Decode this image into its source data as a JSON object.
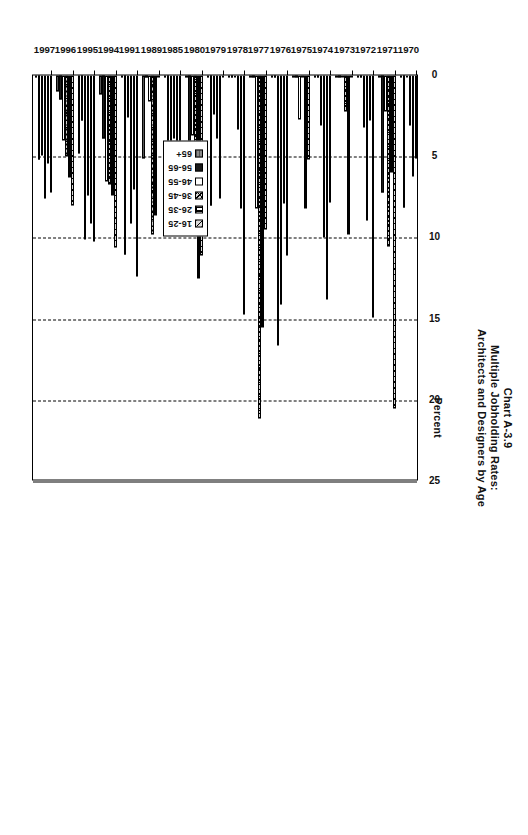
{
  "chart_data": {
    "type": "bar",
    "orientation": "horizontal",
    "title": "Chart A-3.9",
    "subtitle_line1": "Multiple Jobholding Rates:",
    "subtitle_line2": "Architects and Designers by Age",
    "xlabel": "Percent",
    "ylabel": "",
    "xlim": [
      0,
      25
    ],
    "xticks": [
      0,
      5,
      10,
      15,
      20,
      25
    ],
    "xtick_labels": [
      "0",
      "5",
      "10",
      "15",
      "20",
      "25"
    ],
    "grid": true,
    "legend_position": "inside-right",
    "categories": [
      "1970",
      "1971",
      "1972",
      "1973",
      "1974",
      "1975",
      "1976",
      "1977",
      "1978",
      "1979",
      "1980",
      "1985",
      "1989",
      "1991",
      "1994",
      "1995",
      "1996",
      "1997"
    ],
    "series": [
      {
        "name": "16-25",
        "values": [
          5.1,
          20.5,
          14.9,
          0.0,
          7.8,
          5.2,
          11.1,
          9.5,
          14.7,
          0.0,
          11.1,
          8.3,
          0.0,
          12.4,
          10.6,
          10.2,
          8.0,
          7.2
        ]
      },
      {
        "name": "26-35",
        "values": [
          6.2,
          6.0,
          2.8,
          9.8,
          13.8,
          8.2,
          7.9,
          15.5,
          8.2,
          7.6,
          12.5,
          8.3,
          8.6,
          7.0,
          7.4,
          9.1,
          6.3,
          5.4
        ]
      },
      {
        "name": "36-45",
        "values": [
          3.1,
          10.5,
          8.9,
          2.2,
          10.0,
          0.0,
          14.1,
          21.1,
          3.3,
          3.9,
          6.4,
          3.9,
          9.8,
          9.1,
          6.7,
          7.4,
          5.0,
          7.6
        ]
      },
      {
        "name": "46-55",
        "values": [
          0.0,
          2.2,
          3.2,
          0.0,
          3.1,
          2.7,
          16.6,
          8.2,
          0.0,
          2.4,
          3.7,
          6.7,
          1.6,
          2.6,
          6.5,
          10.1,
          4.0,
          4.9
        ]
      },
      {
        "name": "56-65",
        "values": [
          8.1,
          7.2,
          0.0,
          0.0,
          0.0,
          0.0,
          0.0,
          0.0,
          0.0,
          8.0,
          4.8,
          8.4,
          0.0,
          11.0,
          3.9,
          2.8,
          1.5,
          5.2
        ]
      },
      {
        "name": "65+",
        "values": [
          0.0,
          0.0,
          0.0,
          0.0,
          0.0,
          0.0,
          0.0,
          0.0,
          0.0,
          0.0,
          0.0,
          0.0,
          5.1,
          0.0,
          1.2,
          4.8,
          1.0,
          0.0
        ]
      }
    ],
    "series_colors": [
      "#d9d9d9",
      "#ffffff",
      "#cfcfcf",
      "#ffffff",
      "#1a1a1a",
      "#8a8a8a"
    ]
  }
}
